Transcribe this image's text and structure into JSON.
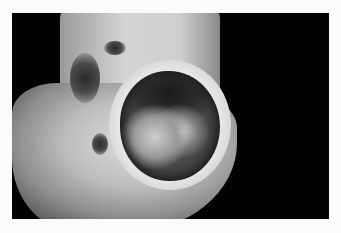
{
  "image": {
    "description": "Grayscale clinical photograph of a heel with a large circular ulcer, dark background, white border",
    "colors": {
      "border": "#fbfbfb",
      "background": "#030303",
      "skin": "#c8c8c8",
      "wound_dark": "#2a2a2a"
    }
  }
}
